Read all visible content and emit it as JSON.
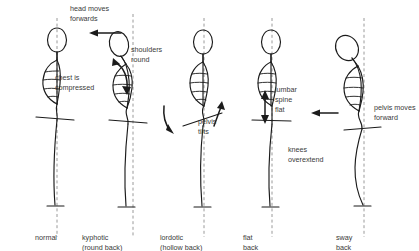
{
  "diagram": {
    "colors": {
      "ink": "#1b1b1b",
      "text": "#3a3a3a",
      "plumb_line": "#9a9a9a",
      "background": "#ffffff"
    },
    "figures": [
      {
        "id": "normal",
        "caption_line1": "normal",
        "caption_line2": "",
        "annotations": []
      },
      {
        "id": "kyphotic",
        "caption_line1": "kyphotic",
        "caption_line2": "(round back)",
        "annotations": [
          {
            "id": "head-moves-forwards",
            "line1": "head moves",
            "line2": "forwards",
            "arrow": "left-arrow"
          },
          {
            "id": "shoulders-round",
            "line1": "shoulders",
            "line2": "round",
            "arrow": "curved-double-arrow"
          },
          {
            "id": "chest-is-compressed",
            "line1": "chest is",
            "line2": "compressed",
            "arrow": "none"
          }
        ]
      },
      {
        "id": "lordotic",
        "caption_line1": "lordotic",
        "caption_line2": "(hollow back)",
        "annotations": [
          {
            "id": "pelvis-tilts",
            "line1": "pelvis",
            "line2": "tilts",
            "arrow": "curved-double-arrow"
          }
        ]
      },
      {
        "id": "flat-back",
        "caption_line1": "flat",
        "caption_line2": "back",
        "annotations": [
          {
            "id": "lumbar-spine-flat",
            "line1": "lumbar",
            "line2": "spine",
            "line3": "flat",
            "arrow": "vertical-double-arrow"
          }
        ]
      },
      {
        "id": "sway-back",
        "caption_line1": "sway",
        "caption_line2": "back",
        "annotations": [
          {
            "id": "pelvis-moves-forward",
            "line1": "pelvis moves",
            "line2": "forward",
            "arrow": "left-arrow"
          },
          {
            "id": "knees-overextend",
            "line1": "knees",
            "line2": "overextend",
            "arrow": "none"
          }
        ]
      }
    ],
    "labels": {
      "head_moves_l1": "head moves",
      "head_moves_l2": "forwards",
      "shoulders_l1": "shoulders",
      "shoulders_l2": "round",
      "chest_l1": "chest is",
      "chest_l2": "compressed",
      "pelvis_tilts_l1": "pelvis",
      "pelvis_tilts_l2": "tilts",
      "lumbar_l1": "lumbar",
      "lumbar_l2": "spine",
      "lumbar_l3": "flat",
      "pelvis_moves_l1": "pelvis moves",
      "pelvis_moves_l2": "forward",
      "knees_l1": "knees",
      "knees_l2": "overextend"
    },
    "captions": {
      "normal_l1": "normal",
      "normal_l2": "",
      "kyphotic_l1": "kyphotic",
      "kyphotic_l2": "(round back)",
      "lordotic_l1": "lordotic",
      "lordotic_l2": "(hollow back)",
      "flat_l1": "flat",
      "flat_l2": "back",
      "sway_l1": "sway",
      "sway_l2": "back"
    }
  }
}
